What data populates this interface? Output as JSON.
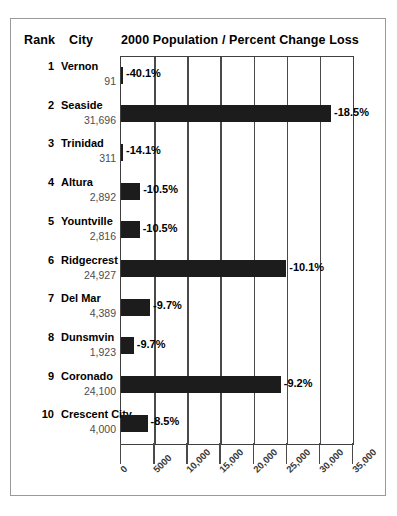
{
  "header": {
    "rank_label": "Rank",
    "city_label": "City",
    "title": "2000 Population  /  Percent Change Loss"
  },
  "chart_data": {
    "type": "bar",
    "title": "2000 Population  /  Percent Change Loss",
    "xlabel": "",
    "ylabel": "",
    "orientation": "horizontal",
    "grid": true,
    "legend": null,
    "xlim": [
      0,
      35000
    ],
    "xticks": [
      0,
      5000,
      10000,
      15000,
      20000,
      25000,
      30000,
      35000
    ],
    "xticklabels": [
      "0",
      "5000",
      "10,000",
      "15,000",
      "20,000",
      "25,000",
      "30,000",
      "35,000"
    ],
    "bar_color": "#1c1c1c",
    "categories": [
      "Vernon",
      "Seaside",
      "Trinidad",
      "Altura",
      "Yountville",
      "Ridgecrest",
      "Del Mar",
      "Dunsmvin",
      "Coronado",
      "Crescent City"
    ],
    "values": [
      91,
      31696,
      311,
      2892,
      2816,
      24927,
      4389,
      1923,
      24100,
      4000
    ],
    "data_labels": [
      "-40.1%",
      "-18.5%",
      "-14.1%",
      "-10.5%",
      "-10.5%",
      "-10.1%",
      "-9.7%",
      "-9.7%",
      "-9.2%",
      "-8.5%"
    ],
    "rows": [
      {
        "rank": "1",
        "city": "Vernon",
        "population": "91",
        "population_value": 91,
        "percent_change": "-40.1%"
      },
      {
        "rank": "2",
        "city": "Seaside",
        "population": "31,696",
        "population_value": 31696,
        "percent_change": "-18.5%"
      },
      {
        "rank": "3",
        "city": "Trinidad",
        "population": "311",
        "population_value": 311,
        "percent_change": "-14.1%"
      },
      {
        "rank": "4",
        "city": "Altura",
        "population": "2,892",
        "population_value": 2892,
        "percent_change": "-10.5%"
      },
      {
        "rank": "5",
        "city": "Yountville",
        "population": "2,816",
        "population_value": 2816,
        "percent_change": "-10.5%"
      },
      {
        "rank": "6",
        "city": "Ridgecrest",
        "population": "24,927",
        "population_value": 24927,
        "percent_change": "-10.1%"
      },
      {
        "rank": "7",
        "city": "Del Mar",
        "population": "4,389",
        "population_value": 4389,
        "percent_change": "-9.7%"
      },
      {
        "rank": "8",
        "city": "Dunsmvin",
        "population": "1,923",
        "population_value": 1923,
        "percent_change": "-9.7%"
      },
      {
        "rank": "9",
        "city": "Coronado",
        "population": "24,100",
        "population_value": 24100,
        "percent_change": "-9.2%"
      },
      {
        "rank": "10",
        "city": "Crescent City",
        "population": "4,000",
        "population_value": 4000,
        "percent_change": "-8.5%"
      }
    ]
  }
}
